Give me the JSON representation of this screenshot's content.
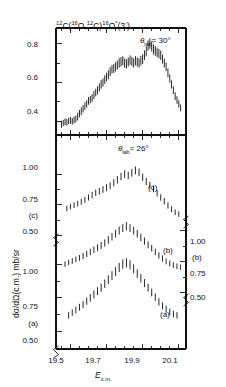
{
  "figure": {
    "title": "12C(16O,12C)16O*(3-)",
    "title_parts": {
      "a_sup": "12",
      "a": "C(",
      "b_sup": "16",
      "b": "O,",
      "c_sup": "12",
      "c": "C)",
      "d_sup": "16",
      "d": "O",
      "star": "*",
      "paren": "(3",
      "minus": "-",
      "close": ")"
    },
    "ylabel": "dσ/dΩ(c.m.) mb/sr",
    "xlabel_main": "E",
    "xlabel_sub": "c.m.",
    "panels": [
      {
        "id": "top",
        "angle_label_theta": "θ",
        "angle_label_sub": "lab",
        "angle_label_value": "= 30°",
        "ytick_labels": [
          "0.8",
          "0.6",
          "0.4"
        ],
        "ytick_values": [
          0.8,
          0.6,
          0.4
        ],
        "series_labels": []
      },
      {
        "id": "bottom",
        "angle_label_theta": "θ",
        "angle_label_sub": "lab",
        "angle_label_value": "= 26°",
        "ytick_labels_left": [
          "1.00",
          "0.75",
          "0.50",
          "1.00",
          "0.75",
          "0.50"
        ],
        "ytick_labels_right": [
          "1.00",
          "0.75",
          "0.50"
        ],
        "curve_label_c": "(c)",
        "curve_label_b": "(b)",
        "curve_label_a": "(a)",
        "axis_label_left_c": "(c)",
        "axis_label_left_a": "(a)",
        "axis_label_right_b": "(b)"
      }
    ],
    "xtick_labels": [
      "19.5",
      "19.7",
      "19.9",
      "20.1"
    ],
    "xtick_values": [
      19.5,
      19.7,
      19.9,
      20.1
    ],
    "colors": {
      "ink": "#111111",
      "data": "#1a1a1a",
      "background": "#ffffff"
    }
  },
  "chart_data": {
    "type": "scatter",
    "title": "12C(16O,12C)16O*(3-)",
    "xlabel": "E c.m.",
    "ylabel": "dσ/dΩ(c.m.) mb/sr",
    "xlim": [
      19.42,
      20.14
    ],
    "grid": false,
    "legend": "none",
    "panels": [
      {
        "name": "theta_lab_30",
        "ylim": [
          0.33,
          0.88
        ],
        "yticks": [
          0.4,
          0.6,
          0.8
        ],
        "x": [
          19.45,
          19.46,
          19.47,
          19.48,
          19.49,
          19.5,
          19.51,
          19.52,
          19.53,
          19.54,
          19.55,
          19.56,
          19.57,
          19.58,
          19.59,
          19.6,
          19.61,
          19.62,
          19.63,
          19.64,
          19.65,
          19.66,
          19.67,
          19.68,
          19.69,
          19.7,
          19.71,
          19.72,
          19.73,
          19.74,
          19.75,
          19.76,
          19.77,
          19.78,
          19.79,
          19.8,
          19.81,
          19.82,
          19.83,
          19.84,
          19.85,
          19.86,
          19.87,
          19.88,
          19.89,
          19.9,
          19.91,
          19.92,
          19.93,
          19.94,
          19.95,
          19.96,
          19.97,
          19.98,
          19.99,
          20.0,
          20.01,
          20.02,
          20.03,
          20.04,
          20.05,
          20.06,
          20.07,
          20.08,
          20.09,
          20.1,
          20.11
        ],
        "y": [
          0.385,
          0.392,
          0.398,
          0.395,
          0.402,
          0.405,
          0.4,
          0.408,
          0.412,
          0.425,
          0.44,
          0.452,
          0.465,
          0.478,
          0.49,
          0.505,
          0.512,
          0.52,
          0.535,
          0.548,
          0.56,
          0.575,
          0.59,
          0.6,
          0.615,
          0.628,
          0.64,
          0.655,
          0.668,
          0.672,
          0.68,
          0.69,
          0.7,
          0.706,
          0.712,
          0.7,
          0.695,
          0.705,
          0.715,
          0.708,
          0.7,
          0.712,
          0.705,
          0.7,
          0.712,
          0.72,
          0.74,
          0.76,
          0.79,
          0.8,
          0.785,
          0.77,
          0.762,
          0.755,
          0.748,
          0.74,
          0.72,
          0.7,
          0.68,
          0.65,
          0.62,
          0.59,
          0.56,
          0.53,
          0.51,
          0.49,
          0.47
        ],
        "yerr": [
          0.018,
          0.016,
          0.018,
          0.017,
          0.016,
          0.018,
          0.017,
          0.018,
          0.017,
          0.02,
          0.019,
          0.02,
          0.019,
          0.02,
          0.019,
          0.02,
          0.019,
          0.02,
          0.021,
          0.02,
          0.021,
          0.021,
          0.022,
          0.021,
          0.022,
          0.022,
          0.023,
          0.023,
          0.022,
          0.023,
          0.024,
          0.023,
          0.024,
          0.024,
          0.023,
          0.024,
          0.024,
          0.023,
          0.024,
          0.023,
          0.024,
          0.024,
          0.023,
          0.024,
          0.024,
          0.025,
          0.025,
          0.026,
          0.026,
          0.027,
          0.026,
          0.025,
          0.025,
          0.024,
          0.024,
          0.024,
          0.023,
          0.023,
          0.022,
          0.022,
          0.021,
          0.021,
          0.02,
          0.02,
          0.019,
          0.019,
          0.018
        ]
      },
      {
        "name": "theta_lab_26_curve_c",
        "ylim": [
          0.44,
          1.18
        ],
        "yticks": [
          0.5,
          0.75,
          1.0
        ],
        "x": [
          19.48,
          19.5,
          19.52,
          19.54,
          19.56,
          19.58,
          19.6,
          19.62,
          19.64,
          19.66,
          19.68,
          19.7,
          19.72,
          19.74,
          19.76,
          19.78,
          19.8,
          19.82,
          19.84,
          19.86,
          19.88,
          19.9,
          19.92,
          19.94,
          19.96,
          19.98,
          20.0,
          20.02,
          20.04,
          20.06,
          20.08,
          20.1
        ],
        "y": [
          0.72,
          0.735,
          0.748,
          0.76,
          0.775,
          0.79,
          0.81,
          0.83,
          0.848,
          0.862,
          0.875,
          0.89,
          0.905,
          0.93,
          0.955,
          0.98,
          1.0,
          0.99,
          1.01,
          1.03,
          1.015,
          0.975,
          0.94,
          0.91,
          0.88,
          0.845,
          0.81,
          0.78,
          0.745,
          0.715,
          0.69,
          0.675
        ],
        "yerr": [
          0.022,
          0.022,
          0.023,
          0.023,
          0.024,
          0.024,
          0.025,
          0.026,
          0.026,
          0.027,
          0.027,
          0.028,
          0.028,
          0.029,
          0.03,
          0.03,
          0.031,
          0.03,
          0.031,
          0.032,
          0.031,
          0.03,
          0.029,
          0.028,
          0.028,
          0.027,
          0.026,
          0.026,
          0.025,
          0.024,
          0.023,
          0.023
        ]
      },
      {
        "name": "theta_lab_26_curve_b",
        "ylim": [
          0.4,
          1.15
        ],
        "yticks": [
          0.5,
          0.75,
          1.0
        ],
        "x": [
          19.47,
          19.49,
          19.51,
          19.53,
          19.55,
          19.57,
          19.59,
          19.61,
          19.63,
          19.65,
          19.67,
          19.69,
          19.71,
          19.73,
          19.75,
          19.77,
          19.79,
          19.81,
          19.83,
          19.85,
          19.87,
          19.89,
          19.91,
          19.93,
          19.95,
          19.97,
          19.99,
          20.01,
          20.03,
          20.05,
          20.07,
          20.09,
          20.11
        ],
        "y": [
          0.73,
          0.742,
          0.755,
          0.768,
          0.78,
          0.795,
          0.812,
          0.828,
          0.845,
          0.862,
          0.88,
          0.9,
          0.925,
          0.95,
          0.975,
          1.0,
          1.02,
          1.035,
          1.02,
          1.0,
          0.975,
          0.945,
          0.915,
          0.885,
          0.858,
          0.828,
          0.8,
          0.775,
          0.752,
          0.735,
          0.722,
          0.712,
          0.705
        ],
        "yerr": [
          0.022,
          0.022,
          0.023,
          0.023,
          0.024,
          0.025,
          0.025,
          0.026,
          0.027,
          0.027,
          0.028,
          0.029,
          0.03,
          0.03,
          0.031,
          0.032,
          0.032,
          0.033,
          0.032,
          0.031,
          0.03,
          0.029,
          0.029,
          0.028,
          0.027,
          0.026,
          0.026,
          0.025,
          0.024,
          0.024,
          0.023,
          0.023,
          0.022
        ]
      },
      {
        "name": "theta_lab_26_curve_a",
        "ylim": [
          0.4,
          1.12
        ],
        "yticks": [
          0.5,
          0.75,
          1.0
        ],
        "x": [
          19.49,
          19.51,
          19.53,
          19.55,
          19.57,
          19.59,
          19.61,
          19.63,
          19.65,
          19.67,
          19.69,
          19.71,
          19.73,
          19.75,
          19.77,
          19.79,
          19.81,
          19.83,
          19.85,
          19.87,
          19.89,
          19.91,
          19.93,
          19.95,
          19.97,
          19.99,
          20.01,
          20.03,
          20.05,
          20.07,
          20.09
        ],
        "y": [
          0.62,
          0.64,
          0.66,
          0.68,
          0.7,
          0.725,
          0.75,
          0.775,
          0.8,
          0.825,
          0.855,
          0.885,
          0.915,
          0.945,
          0.975,
          1.0,
          1.01,
          0.995,
          0.965,
          0.93,
          0.895,
          0.86,
          0.825,
          0.79,
          0.755,
          0.72,
          0.69,
          0.665,
          0.645,
          0.63,
          0.62
        ],
        "yerr": [
          0.024,
          0.024,
          0.025,
          0.026,
          0.026,
          0.027,
          0.028,
          0.029,
          0.029,
          0.03,
          0.031,
          0.032,
          0.033,
          0.033,
          0.034,
          0.035,
          0.035,
          0.034,
          0.033,
          0.032,
          0.031,
          0.03,
          0.029,
          0.029,
          0.028,
          0.027,
          0.026,
          0.026,
          0.025,
          0.025,
          0.024
        ]
      }
    ]
  }
}
